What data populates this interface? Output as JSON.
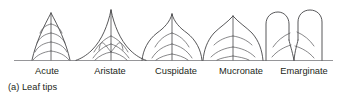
{
  "figure": {
    "caption": "(a) Leaf tips",
    "background_color": "#ffffff",
    "stroke_color": "#3a3a3c",
    "text_color": "#231f20",
    "baseline_color": "#7b7b7f",
    "baseline_y": 60
  },
  "items": [
    {
      "label": "Acute",
      "label_x": 47,
      "label_y": 74,
      "description": "pointed tip with straight-to-slightly-convex converging sides",
      "center_x": 51,
      "vein_pairs": 4
    },
    {
      "label": "Aristate",
      "label_x": 110,
      "label_y": 74,
      "description": "long narrow bristle-like awn at the apex with concave sides",
      "center_x": 111,
      "vein_pairs": 3
    },
    {
      "label": "Cuspidate",
      "label_x": 176,
      "label_y": 74,
      "description": "abrupt sharp rigid point on a broad blade",
      "center_x": 172,
      "vein_pairs": 3
    },
    {
      "label": "Mucronate",
      "label_x": 241,
      "label_y": 74,
      "description": "rounded apex ending in a small abrupt short point",
      "center_x": 233,
      "vein_pairs": 3
    },
    {
      "label": "Emarginate",
      "label_x": 304,
      "label_y": 74,
      "description": "notched apex forming two rounded lobes",
      "center_x": 294,
      "vein_pairs": 3
    }
  ]
}
